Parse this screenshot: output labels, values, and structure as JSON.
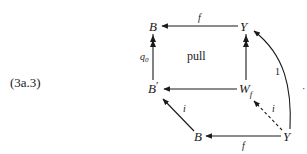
{
  "equation_label": "(3a.3)",
  "nodes": {
    "top_left": "B",
    "top_right": "Y",
    "mid_left": "B",
    "mid_left_prime": "′",
    "mid_right": "W",
    "mid_right_sub": "f",
    "bottom_left": "B",
    "bottom_right": "Y"
  },
  "edges": {
    "top_f": "f",
    "left_q0": "q",
    "left_q0_sub": "0",
    "bottom_f": "f",
    "diag_i_left": "i",
    "diag_i_right": "i",
    "curve_identity": "1"
  },
  "square_label": "pull",
  "stray_mark": "·",
  "colors": {
    "ink": "#1a1a1a",
    "background": "#ffffff"
  }
}
